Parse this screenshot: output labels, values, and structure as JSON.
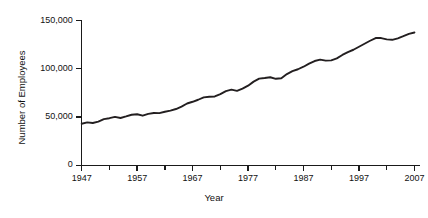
{
  "chart_data": {
    "type": "line",
    "title": "",
    "xlabel": "Year",
    "ylabel": "Number of Employees",
    "xlim": [
      1947,
      2008
    ],
    "ylim": [
      0,
      150000
    ],
    "grid": false,
    "legend": "none",
    "y_ticks": [
      {
        "value": 0,
        "label": "0"
      },
      {
        "value": 50000,
        "label": "50,000"
      },
      {
        "value": 100000,
        "label": "100,000"
      },
      {
        "value": 150000,
        "label": "150,000"
      }
    ],
    "x_ticks_major": [
      {
        "value": 1947,
        "label": "1947"
      },
      {
        "value": 1957,
        "label": "1957"
      },
      {
        "value": 1967,
        "label": "1967"
      },
      {
        "value": 1977,
        "label": "1977"
      },
      {
        "value": 1987,
        "label": "1987"
      },
      {
        "value": 1997,
        "label": "1997"
      },
      {
        "value": 2007,
        "label": "2007"
      }
    ],
    "x_ticks_minor": [
      1952,
      1962,
      1972,
      1982,
      1992,
      2002
    ],
    "series": [
      {
        "name": "Number of Employees",
        "color": "#231f20",
        "x": [
          1947,
          1948,
          1949,
          1950,
          1951,
          1952,
          1953,
          1954,
          1955,
          1956,
          1957,
          1958,
          1959,
          1960,
          1961,
          1962,
          1963,
          1964,
          1965,
          1966,
          1967,
          1968,
          1969,
          1970,
          1971,
          1972,
          1973,
          1974,
          1975,
          1976,
          1977,
          1978,
          1979,
          1980,
          1981,
          1982,
          1983,
          1984,
          1985,
          1986,
          1987,
          1988,
          1989,
          1990,
          1991,
          1992,
          1993,
          1994,
          1995,
          1996,
          1997,
          1998,
          1999,
          2000,
          2001,
          2002,
          2003,
          2004,
          2005,
          2006,
          2007
        ],
        "values": [
          43000,
          44500,
          43800,
          45200,
          47800,
          48800,
          50200,
          49000,
          50600,
          52400,
          52900,
          51400,
          53300,
          54200,
          54000,
          55500,
          56700,
          58300,
          60800,
          64000,
          65800,
          67900,
          70400,
          71000,
          71300,
          73800,
          76900,
          78400,
          77100,
          79400,
          82500,
          86700,
          89800,
          90400,
          91200,
          89600,
          90200,
          94500,
          97500,
          99500,
          102100,
          105300,
          108000,
          109500,
          108400,
          108700,
          110800,
          114300,
          117300,
          119700,
          122800,
          125900,
          129000,
          131800,
          131800,
          130400,
          130000,
          131500,
          133700,
          136100,
          137600
        ]
      }
    ]
  },
  "axis_titles": {
    "y": "Number of Employees",
    "x": "Year"
  }
}
